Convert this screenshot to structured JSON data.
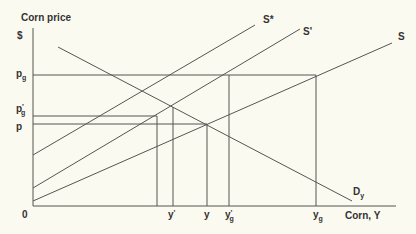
{
  "diagram": {
    "title": "Corn price",
    "y_axis_label": "$",
    "x_axis_label": "Corn, Y",
    "origin_label": "0",
    "price_labels": [
      {
        "base": "p",
        "sub": "g",
        "sup": ""
      },
      {
        "base": "p",
        "sub": "g",
        "sup": "'"
      },
      {
        "base": "p",
        "sub": "",
        "sup": ""
      }
    ],
    "quantity_labels": [
      {
        "base": "y",
        "sub": "",
        "sup": "'"
      },
      {
        "base": "y",
        "sub": "",
        "sup": ""
      },
      {
        "base": "y",
        "sub": "g",
        "sup": "'"
      },
      {
        "base": "y",
        "sub": "g",
        "sup": ""
      }
    ],
    "curves": {
      "s_star": "S*",
      "s_prime": "S'",
      "s": "S",
      "demand": {
        "base": "D",
        "sub": "y"
      }
    },
    "line_color": "#555555",
    "background": "#fbfaf0"
  }
}
